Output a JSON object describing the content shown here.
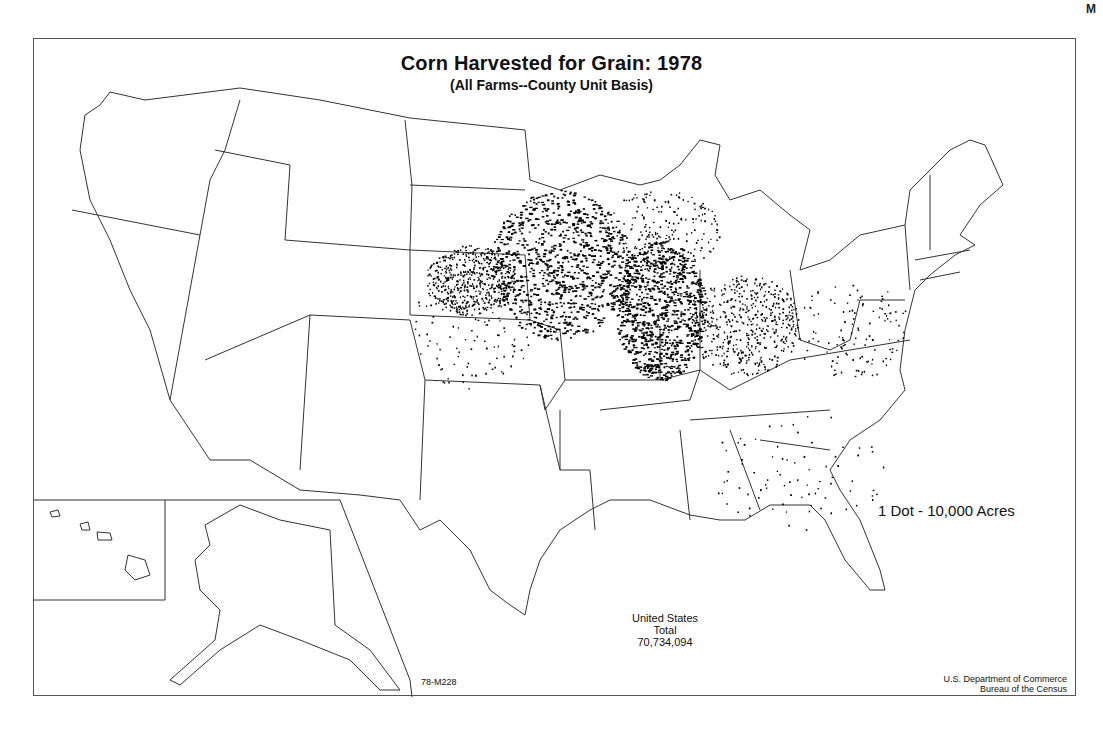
{
  "page": {
    "corner_mark": "M"
  },
  "map": {
    "title": "Corn Harvested for Grain:  1978",
    "subtitle": "(All Farms--County Unit Basis)",
    "legend": "1 Dot - 10,000 Acres",
    "total": {
      "line1": "United States",
      "line2": "Total",
      "value": "70,734,094"
    },
    "map_code": "78-M228",
    "credit": {
      "line1": "U.S. Department of Commerce",
      "line2": "Bureau of the Census"
    },
    "insets": [
      "Alaska",
      "Hawaii"
    ],
    "colors": {
      "background": "#ffffff",
      "boundaries": "#333333",
      "dots": "#000000"
    },
    "dense_regions": [
      {
        "name": "Iowa / southern Minnesota",
        "cx": 560,
        "cy": 265,
        "rx": 70,
        "ry": 75,
        "density": "very-high"
      },
      {
        "name": "Illinois",
        "cx": 660,
        "cy": 310,
        "rx": 45,
        "ry": 70,
        "density": "very-high"
      },
      {
        "name": "Indiana / Ohio",
        "cx": 745,
        "cy": 325,
        "rx": 55,
        "ry": 50,
        "density": "high"
      },
      {
        "name": "Eastern Nebraska",
        "cx": 470,
        "cy": 280,
        "rx": 45,
        "ry": 35,
        "density": "high"
      },
      {
        "name": "Southern Wisconsin / Michigan",
        "cx": 660,
        "cy": 230,
        "rx": 60,
        "ry": 40,
        "density": "medium"
      },
      {
        "name": "Eastern South Dakota / Kansas",
        "cx": 470,
        "cy": 330,
        "rx": 60,
        "ry": 60,
        "density": "low"
      },
      {
        "name": "Mid-Atlantic / Pennsylvania",
        "cx": 850,
        "cy": 330,
        "rx": 60,
        "ry": 50,
        "density": "low"
      },
      {
        "name": "Southeast Piedmont",
        "cx": 800,
        "cy": 470,
        "rx": 90,
        "ry": 60,
        "density": "sparse"
      }
    ]
  }
}
